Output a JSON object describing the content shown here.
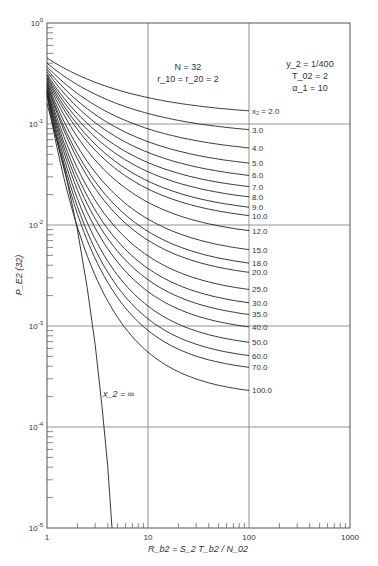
{
  "chart_data": {
    "type": "line",
    "title": "",
    "xlabel": "R_b2 = S_2 T_b2 / N_02",
    "ylabel": "P_E2 (32)",
    "xscale": "log",
    "yscale": "log",
    "xlim": [
      1,
      1000
    ],
    "ylim": [
      1e-05,
      1
    ],
    "grid": true,
    "x_ticks": [
      "1",
      "10",
      "100",
      "1000"
    ],
    "y_ticks": [
      "10^0",
      "10^-1",
      "10^-2",
      "10^-3",
      "10^-4",
      "10^-5"
    ],
    "annotations": {
      "left_block": [
        "N = 32",
        "r_10 = r_20 = 2"
      ],
      "right_block": [
        "y_2 = 1/400",
        "T_02 = 2",
        "α_1 = 10"
      ],
      "infinity_label": "x_2 = ∞"
    },
    "series": [
      {
        "name": "x2 = 2.0",
        "label": "x₂ = 2.0",
        "start": 0.45,
        "end": 0.135
      },
      {
        "name": "x2 = 3.0",
        "label": "3.0",
        "start": 0.4,
        "end": 0.088
      },
      {
        "name": "x2 = 4.0",
        "label": "4.0",
        "start": 0.37,
        "end": 0.058
      },
      {
        "name": "x2 = 5.0",
        "label": "5.0",
        "start": 0.35,
        "end": 0.041
      },
      {
        "name": "x2 = 6.0",
        "label": "6.0",
        "start": 0.33,
        "end": 0.031
      },
      {
        "name": "x2 = 7.0",
        "label": "7.0",
        "start": 0.31,
        "end": 0.024
      },
      {
        "name": "x2 = 8.0",
        "label": "8.0",
        "start": 0.3,
        "end": 0.019
      },
      {
        "name": "x2 = 9.0",
        "label": "9.0",
        "start": 0.29,
        "end": 0.015
      },
      {
        "name": "x2 = 10.0",
        "label": "10.0",
        "start": 0.28,
        "end": 0.0124
      },
      {
        "name": "x2 = 12.0",
        "label": "12.0",
        "start": 0.27,
        "end": 0.0088
      },
      {
        "name": "x2 = 15.0",
        "label": "15.0",
        "start": 0.26,
        "end": 0.0057
      },
      {
        "name": "x2 = 18.0",
        "label": "18.0",
        "start": 0.25,
        "end": 0.0042
      },
      {
        "name": "x2 = 20.0",
        "label": "20.0",
        "start": 0.245,
        "end": 0.0034
      },
      {
        "name": "x2 = 25.0",
        "label": "25.0",
        "start": 0.235,
        "end": 0.0023
      },
      {
        "name": "x2 = 30.0",
        "label": "30.0",
        "start": 0.225,
        "end": 0.0017
      },
      {
        "name": "x2 = 35.0",
        "label": "35.0",
        "start": 0.22,
        "end": 0.0013
      },
      {
        "name": "x2 = 40.0",
        "label": "40.0",
        "start": 0.215,
        "end": 0.00098
      },
      {
        "name": "x2 = 50.0",
        "label": "50.0",
        "start": 0.21,
        "end": 0.00069
      },
      {
        "name": "x2 = 60.0",
        "label": "60.0",
        "start": 0.205,
        "end": 0.00051
      },
      {
        "name": "x2 = 70.0",
        "label": "70.0",
        "start": 0.2,
        "end": 0.00039
      },
      {
        "name": "x2 = 100.0",
        "label": "100.0",
        "start": 0.19,
        "end": 0.00023
      }
    ],
    "infinity_curve": {
      "name": "x2 = ∞",
      "points": [
        [
          1,
          0.16
        ],
        [
          1.5,
          0.035
        ],
        [
          2,
          0.009
        ],
        [
          2.5,
          0.0024
        ],
        [
          3,
          0.00065
        ],
        [
          3.5,
          0.00016
        ],
        [
          4,
          4e-05
        ],
        [
          4.4,
          1e-05
        ]
      ]
    }
  },
  "axis_text": {
    "x_label_main": "R",
    "x_label_eq": "= S",
    "x_label_tail": "/N",
    "y_label_main": "P",
    "y_label_tail": "(32)",
    "tick_1": "1",
    "tick_10": "10",
    "tick_100": "100",
    "tick_1000": "1000",
    "ten": "10"
  }
}
